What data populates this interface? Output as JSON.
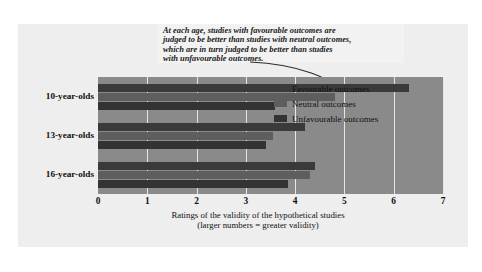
{
  "annotation": {
    "text": "At each age, studies with favourable outcomes are\njudged to be better than studies with neutral outcomes,\nwhich are in turn judged to be better than studies\nwith unfavourable outcomes."
  },
  "legend": {
    "items": [
      {
        "label": "Favourable outcomes",
        "color": "#3a3a3a"
      },
      {
        "label": "Neutral outcomes",
        "color": "#5e5e5e"
      },
      {
        "label": "Unfavourable outcomes",
        "color": "#333333"
      }
    ]
  },
  "axis": {
    "caption_line1": "Ratings of the validity of the hypothetical studies",
    "caption_line2": "(larger numbers = greater validity)",
    "ticks": [
      "0",
      "1",
      "2",
      "3",
      "4",
      "5",
      "6",
      "7"
    ]
  },
  "chart_data": {
    "type": "bar",
    "orientation": "horizontal",
    "title": "",
    "xlabel": "Ratings of the validity of the hypothetical studies (larger numbers = greater validity)",
    "ylabel": "",
    "xlim": [
      0,
      7
    ],
    "grid": true,
    "legend_position": "inside-right",
    "categories": [
      "10-year-olds",
      "13-year-olds",
      "16-year-olds"
    ],
    "series": [
      {
        "name": "Favourable outcomes",
        "color": "#3a3a3a",
        "values": [
          6.3,
          4.2,
          4.4
        ]
      },
      {
        "name": "Neutral outcomes",
        "color": "#5e5e5e",
        "values": [
          4.8,
          3.55,
          4.3
        ]
      },
      {
        "name": "Unfavourable outcomes",
        "color": "#333333",
        "values": [
          3.6,
          3.4,
          3.85
        ]
      }
    ],
    "annotation": "At each age, studies with favourable outcomes are judged to be better than studies with neutral outcomes, which are in turn judged to be better than studies with unfavourable outcomes."
  }
}
